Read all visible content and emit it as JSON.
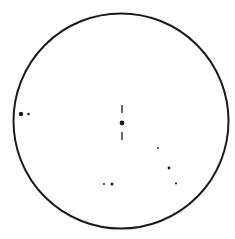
{
  "field": {
    "shape": "circle",
    "cx": 121,
    "cy": 121,
    "r": 107.5,
    "stroke": "#1a1a1a",
    "stroke_width": 2
  },
  "target": {
    "x": 122,
    "y": 123,
    "r": 2.4,
    "marker_top": [
      105,
      113
    ],
    "marker_bottom": [
      132,
      140
    ]
  },
  "stars": [
    {
      "x": 21,
      "y": 114,
      "r": 2.2
    },
    {
      "x": 28.5,
      "y": 114,
      "r": 1.3
    },
    {
      "x": 158,
      "y": 148,
      "r": 0.9
    },
    {
      "x": 169,
      "y": 168,
      "r": 1.4
    },
    {
      "x": 176,
      "y": 183.5,
      "r": 1.1
    },
    {
      "x": 104,
      "y": 184,
      "r": 1.0
    },
    {
      "x": 112,
      "y": 184,
      "r": 1.5
    }
  ],
  "colors": {
    "ink": "#1a1a1a",
    "background": "#ffffff"
  }
}
